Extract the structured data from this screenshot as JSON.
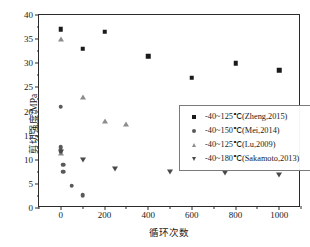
{
  "chart_data": {
    "type": "scatter",
    "title": "",
    "xlabel": "循环次数",
    "ylabel": "剪切强度/MPa",
    "xlim": [
      -100,
      1100
    ],
    "ylim": [
      0,
      40
    ],
    "xticks": [
      0,
      200,
      400,
      600,
      800,
      1000
    ],
    "yticks": [
      0,
      5,
      10,
      15,
      20,
      25,
      30,
      35,
      40
    ],
    "xtick_labels": [
      "0",
      "200",
      "400",
      "600",
      "800",
      "1000"
    ],
    "ytick_labels": [
      "0",
      "5",
      "10",
      "15",
      "20",
      "25",
      "30",
      "35",
      "40"
    ],
    "grid": false,
    "legend_position": "center-right",
    "series": [
      {
        "name": "-40~125℃(Zheng,2015)",
        "marker": "square",
        "color": "#1a1a1a",
        "points": [
          {
            "x": 0,
            "y": 37.0
          },
          {
            "x": 100,
            "y": 33.0
          },
          {
            "x": 200,
            "y": 36.5
          },
          {
            "x": 400,
            "y": 31.5
          },
          {
            "x": 600,
            "y": 27.0
          },
          {
            "x": 800,
            "y": 30.0
          },
          {
            "x": 1000,
            "y": 28.5
          }
        ]
      },
      {
        "name": "-40~150℃(Mei,2014)",
        "marker": "circle",
        "color": "#5a5a5a",
        "points": [
          {
            "x": 0,
            "y": 21.0
          },
          {
            "x": 0,
            "y": 12.6
          },
          {
            "x": 0,
            "y": 11.8
          },
          {
            "x": 10,
            "y": 9.0
          },
          {
            "x": 10,
            "y": 7.5
          },
          {
            "x": 50,
            "y": 4.6
          },
          {
            "x": 100,
            "y": 2.6
          }
        ]
      },
      {
        "name": "-40~125℃(Lu,2009)",
        "marker": "triangle-up",
        "color": "#8d8d8d",
        "points": [
          {
            "x": 0,
            "y": 35.0
          },
          {
            "x": 0,
            "y": 11.5
          },
          {
            "x": 100,
            "y": 23.0
          },
          {
            "x": 200,
            "y": 18.0
          },
          {
            "x": 300,
            "y": 17.5
          }
        ]
      },
      {
        "name": "-40~180℃(Sakamoto,2013)",
        "marker": "triangle-down",
        "color": "#4a4a4a",
        "points": [
          {
            "x": 0,
            "y": 11.7
          },
          {
            "x": 100,
            "y": 10.0
          },
          {
            "x": 250,
            "y": 8.0
          },
          {
            "x": 500,
            "y": 7.5
          },
          {
            "x": 750,
            "y": 7.2
          },
          {
            "x": 1000,
            "y": 6.9
          }
        ]
      }
    ]
  }
}
